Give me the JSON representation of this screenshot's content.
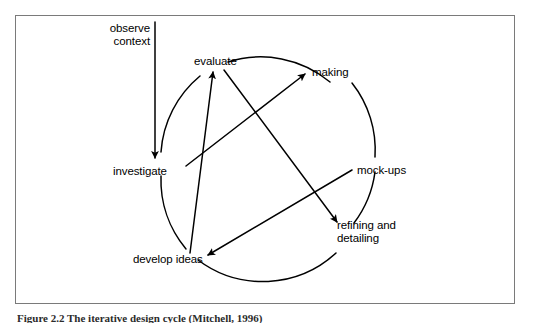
{
  "figure": {
    "caption": "Figure 2.2 The iterative design cycle (Mitchell, 1996)",
    "frame_color": "#7a7a7a",
    "ink_color": "#000000",
    "background": "#ffffff"
  },
  "diagram": {
    "type": "cycle-diagram",
    "title": "iterative design cycle",
    "nodes": [
      {
        "id": "observe-context",
        "label": "observe\ncontext",
        "x": 148,
        "y": 23,
        "align": "right"
      },
      {
        "id": "evaluate",
        "label": "evaluate",
        "x": 194,
        "y": 55,
        "align": "left"
      },
      {
        "id": "making",
        "label": "making",
        "x": 312,
        "y": 66,
        "align": "left"
      },
      {
        "id": "investigate",
        "label": "investigate",
        "x": 113,
        "y": 165,
        "align": "left"
      },
      {
        "id": "mock-ups",
        "label": "mock-ups",
        "x": 357,
        "y": 164,
        "align": "left"
      },
      {
        "id": "develop-ideas",
        "label": "develop ideas",
        "x": 133,
        "y": 253,
        "align": "left"
      },
      {
        "id": "refining-detailing",
        "label": "refining and\ndetailing",
        "x": 337,
        "y": 219,
        "align": "left"
      }
    ],
    "edges": [
      {
        "id": "observe-to-investigate",
        "from": "observe context",
        "to": "investigate",
        "kind": "straight",
        "arrow": "end"
      },
      {
        "id": "investigate-to-making",
        "from": "investigate",
        "to": "making",
        "kind": "straight",
        "arrow": "end"
      },
      {
        "id": "develop-to-evaluate",
        "from": "develop ideas",
        "to": "evaluate",
        "kind": "straight",
        "arrow": "end"
      },
      {
        "id": "evaluate-to-refining",
        "from": "evaluate",
        "to": "refining and detailing",
        "kind": "straight",
        "arrow": "end"
      },
      {
        "id": "mockups-to-develop",
        "from": "mock-ups",
        "to": "develop ideas",
        "kind": "straight",
        "arrow": "end"
      }
    ],
    "arcs": [
      {
        "id": "arc-evaluate-making",
        "between": "evaluate → making",
        "kind": "arc"
      },
      {
        "id": "arc-making-mockups",
        "between": "making → mock-ups",
        "kind": "arc"
      },
      {
        "id": "arc-mockups-refining",
        "between": "mock-ups → refining and detailing",
        "kind": "arc"
      },
      {
        "id": "arc-refining-develop",
        "between": "refining and detailing → develop ideas",
        "kind": "arc"
      },
      {
        "id": "arc-develop-investigate",
        "between": "develop ideas → investigate",
        "kind": "arc"
      },
      {
        "id": "arc-investigate-evaluate",
        "between": "investigate → evaluate",
        "kind": "arc"
      }
    ]
  }
}
